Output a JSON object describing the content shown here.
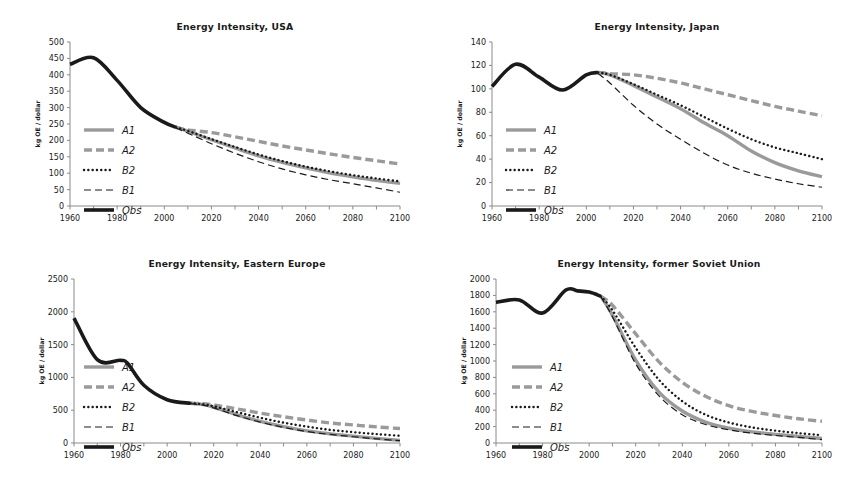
{
  "figure": {
    "background": "#ffffff",
    "series_colors": {
      "gray": "#9a9a9a",
      "black": "#1a1a1a"
    }
  },
  "legend": {
    "items": [
      {
        "label": "A1",
        "style": "solid-thick-gray",
        "color": "#9a9a9a"
      },
      {
        "label": "A2",
        "style": "dashed-thick-gray",
        "color": "#9a9a9a"
      },
      {
        "label": "B2",
        "style": "dotted-black",
        "color": "#1a1a1a"
      },
      {
        "label": "B1",
        "style": "dashed-thin-black",
        "color": "#1a1a1a"
      },
      {
        "label": "Obs",
        "style": "solid-thick-black",
        "color": "#1a1a1a"
      }
    ]
  },
  "chart_data": [
    {
      "id": "usa",
      "type": "line",
      "title": "Energy Intensity, USA",
      "xlabel": "",
      "ylabel": "kg OE / dollar",
      "xlim": [
        1960,
        2100
      ],
      "ylim": [
        0,
        500
      ],
      "ytick_step": 50,
      "yticks": [
        0,
        50,
        100,
        150,
        200,
        250,
        300,
        350,
        400,
        450,
        500
      ],
      "xticks": [
        1960,
        1970,
        1980,
        1990,
        2000,
        2010,
        2020,
        2030,
        2040,
        2050,
        2060,
        2070,
        2080,
        2090,
        2100
      ],
      "xtick_labels": [
        1960,
        1980,
        2000,
        2020,
        2040,
        2060,
        2080,
        2100
      ],
      "grid": false,
      "legend_position": "inner-left",
      "series": [
        {
          "name": "Obs",
          "x": [
            1960,
            1970,
            1980,
            1990,
            2000,
            2005
          ],
          "values": [
            432,
            452,
            383,
            300,
            255,
            240
          ]
        },
        {
          "name": "A1",
          "x": [
            2005,
            2010,
            2020,
            2030,
            2040,
            2050,
            2060,
            2070,
            2080,
            2090,
            2100
          ],
          "values": [
            240,
            228,
            202,
            177,
            153,
            133,
            116,
            101,
            89,
            78,
            69
          ]
        },
        {
          "name": "A2",
          "x": [
            2005,
            2010,
            2020,
            2030,
            2040,
            2050,
            2060,
            2070,
            2080,
            2090,
            2100
          ],
          "values": [
            240,
            232,
            224,
            211,
            197,
            183,
            171,
            159,
            148,
            138,
            128
          ]
        },
        {
          "name": "B2",
          "x": [
            2005,
            2010,
            2020,
            2030,
            2040,
            2050,
            2060,
            2070,
            2080,
            2090,
            2100
          ],
          "values": [
            240,
            229,
            204,
            180,
            157,
            137,
            120,
            106,
            94,
            84,
            75
          ]
        },
        {
          "name": "B1",
          "x": [
            2005,
            2010,
            2020,
            2030,
            2040,
            2050,
            2060,
            2070,
            2080,
            2090,
            2100
          ],
          "values": [
            238,
            222,
            190,
            161,
            135,
            113,
            95,
            80,
            68,
            55,
            42
          ]
        }
      ]
    },
    {
      "id": "japan",
      "type": "line",
      "title": "Energy Intensity, Japan",
      "xlabel": "",
      "ylabel": "kg OE / dollar",
      "xlim": [
        1960,
        2100
      ],
      "ylim": [
        0,
        140
      ],
      "ytick_step": 20,
      "yticks": [
        0,
        20,
        40,
        60,
        80,
        100,
        120,
        140
      ],
      "xticks": [
        1960,
        1970,
        1980,
        1990,
        2000,
        2010,
        2020,
        2030,
        2040,
        2050,
        2060,
        2070,
        2080,
        2090,
        2100
      ],
      "xtick_labels": [
        1960,
        1980,
        2000,
        2020,
        2040,
        2060,
        2080,
        2100
      ],
      "grid": false,
      "legend_position": "inner-left",
      "series": [
        {
          "name": "Obs",
          "x": [
            1960,
            1970,
            1980,
            1990,
            2000,
            2005
          ],
          "values": [
            102,
            121,
            110,
            99,
            112,
            114
          ]
        },
        {
          "name": "A1",
          "x": [
            2005,
            2010,
            2020,
            2030,
            2040,
            2050,
            2060,
            2070,
            2080,
            2090,
            2100
          ],
          "values": [
            114,
            112,
            103,
            93,
            83,
            71,
            60,
            47,
            37,
            30,
            25
          ]
        },
        {
          "name": "A2",
          "x": [
            2005,
            2010,
            2020,
            2030,
            2040,
            2050,
            2060,
            2070,
            2080,
            2090,
            2100
          ],
          "values": [
            114,
            113,
            112,
            109,
            105,
            100,
            95,
            90,
            85,
            81,
            77
          ]
        },
        {
          "name": "B2",
          "x": [
            2005,
            2010,
            2020,
            2030,
            2040,
            2050,
            2060,
            2070,
            2080,
            2090,
            2100
          ],
          "values": [
            114,
            112,
            104,
            95,
            86,
            76,
            66,
            57,
            50,
            45,
            40
          ]
        },
        {
          "name": "B1",
          "x": [
            2005,
            2010,
            2020,
            2030,
            2040,
            2050,
            2060,
            2070,
            2080,
            2090,
            2100
          ],
          "values": [
            113,
            105,
            86,
            70,
            57,
            45,
            35,
            28,
            23,
            19,
            16
          ]
        }
      ]
    },
    {
      "id": "eastern-europe",
      "type": "line",
      "title": "Energy Intensity, Eastern Europe",
      "xlabel": "",
      "ylabel": "kg OE / dollar",
      "xlim": [
        1960,
        2100
      ],
      "ylim": [
        0,
        2500
      ],
      "ytick_step": 500,
      "yticks": [
        0,
        500,
        1000,
        1500,
        2000,
        2500
      ],
      "xticks": [
        1960,
        1970,
        1980,
        1990,
        2000,
        2010,
        2020,
        2030,
        2040,
        2050,
        2060,
        2070,
        2080,
        2090,
        2100
      ],
      "xtick_labels": [
        1960,
        1980,
        2000,
        2020,
        2040,
        2060,
        2080,
        2100
      ],
      "grid": false,
      "legend_position": "inner-left",
      "series": [
        {
          "name": "Obs",
          "x": [
            1960,
            1970,
            1980,
            1983,
            1990,
            2000,
            2010
          ],
          "values": [
            1905,
            1270,
            1260,
            1215,
            880,
            660,
            605
          ]
        },
        {
          "name": "A1",
          "x": [
            2010,
            2015,
            2020,
            2030,
            2040,
            2050,
            2060,
            2070,
            2080,
            2090,
            2100
          ],
          "values": [
            605,
            588,
            545,
            430,
            330,
            250,
            185,
            140,
            105,
            70,
            40
          ]
        },
        {
          "name": "A2",
          "x": [
            2010,
            2015,
            2020,
            2030,
            2040,
            2050,
            2060,
            2070,
            2080,
            2090,
            2100
          ],
          "values": [
            605,
            600,
            580,
            520,
            455,
            400,
            350,
            305,
            275,
            245,
            220
          ]
        },
        {
          "name": "B2",
          "x": [
            2010,
            2015,
            2020,
            2030,
            2040,
            2050,
            2060,
            2070,
            2080,
            2090,
            2100
          ],
          "values": [
            605,
            592,
            560,
            470,
            385,
            310,
            250,
            200,
            165,
            135,
            110
          ]
        },
        {
          "name": "B1",
          "x": [
            2010,
            2015,
            2020,
            2030,
            2040,
            2050,
            2060,
            2070,
            2080,
            2090,
            2100
          ],
          "values": [
            600,
            580,
            535,
            418,
            318,
            238,
            175,
            130,
            95,
            62,
            35
          ]
        }
      ]
    },
    {
      "id": "former-soviet-union",
      "type": "line",
      "title": "Energy Intensity, former Soviet Union",
      "xlabel": "",
      "ylabel": "kg OE / dollar",
      "xlim": [
        1960,
        2100
      ],
      "ylim": [
        0,
        2000
      ],
      "ytick_step": 200,
      "yticks": [
        0,
        200,
        400,
        600,
        800,
        1000,
        1200,
        1400,
        1600,
        1800,
        2000
      ],
      "xticks": [
        1960,
        1970,
        1980,
        1990,
        2000,
        2010,
        2020,
        2030,
        2040,
        2050,
        2060,
        2070,
        2080,
        2090,
        2100
      ],
      "xtick_labels": [
        1960,
        1980,
        2000,
        2020,
        2040,
        2060,
        2080,
        2100
      ],
      "grid": false,
      "legend_position": "inner-left",
      "series": [
        {
          "name": "Obs",
          "x": [
            1960,
            1970,
            1980,
            1990,
            1995,
            2000,
            2005
          ],
          "values": [
            1715,
            1745,
            1585,
            1865,
            1855,
            1840,
            1790
          ]
        },
        {
          "name": "A1",
          "x": [
            2005,
            2010,
            2020,
            2030,
            2040,
            2050,
            2060,
            2070,
            2080,
            2090,
            2100
          ],
          "values": [
            1790,
            1560,
            1010,
            620,
            390,
            255,
            180,
            135,
            105,
            80,
            55
          ]
        },
        {
          "name": "A2",
          "x": [
            2005,
            2010,
            2020,
            2030,
            2040,
            2050,
            2060,
            2070,
            2080,
            2090,
            2100
          ],
          "values": [
            1790,
            1680,
            1330,
            990,
            740,
            570,
            455,
            385,
            335,
            295,
            265
          ]
        },
        {
          "name": "B2",
          "x": [
            2005,
            2010,
            2020,
            2030,
            2040,
            2050,
            2060,
            2070,
            2080,
            2090,
            2100
          ],
          "values": [
            1790,
            1620,
            1160,
            770,
            510,
            345,
            250,
            190,
            150,
            120,
            95
          ]
        },
        {
          "name": "B1",
          "x": [
            2005,
            2010,
            2020,
            2030,
            2040,
            2050,
            2060,
            2070,
            2080,
            2090,
            2100
          ],
          "values": [
            1785,
            1540,
            965,
            575,
            345,
            225,
            160,
            120,
            92,
            68,
            42
          ]
        }
      ]
    }
  ]
}
